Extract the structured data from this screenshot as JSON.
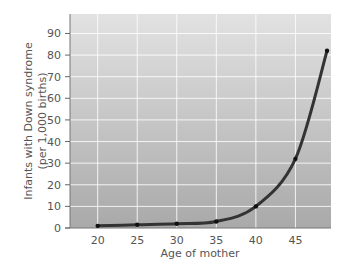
{
  "chart_data": {
    "type": "line",
    "title": "",
    "xlabel": "Age of mother",
    "ylabel": "Infants with Down syndrome (per 1,000 births)",
    "ylabel_lines": [
      "Infants with Down syndrome",
      "(per 1,000 births)"
    ],
    "x": [
      20,
      25,
      30,
      35,
      40,
      45,
      49
    ],
    "series": [
      {
        "name": "Down syndrome incidence",
        "values": [
          1,
          1.5,
          2,
          3,
          10,
          32,
          82
        ]
      }
    ],
    "x_ticks": [
      20,
      25,
      30,
      35,
      40,
      45
    ],
    "y_ticks": [
      0,
      10,
      20,
      30,
      40,
      50,
      60,
      70,
      80,
      90
    ],
    "xlim": [
      16.5,
      49.5
    ],
    "ylim": [
      0,
      99
    ],
    "grid": true,
    "legend": "none",
    "colors": {
      "line": "#333333",
      "grid": "#ffffff",
      "bg_top": "#dedede",
      "bg_bottom": "#a8a8a8"
    }
  }
}
